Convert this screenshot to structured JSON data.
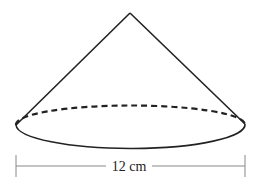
{
  "diagram": {
    "shape": "cone",
    "base_diameter_label": "12 cm",
    "colors": {
      "stroke": "#222222",
      "dimension": "#888888",
      "background": "#ffffff"
    }
  }
}
